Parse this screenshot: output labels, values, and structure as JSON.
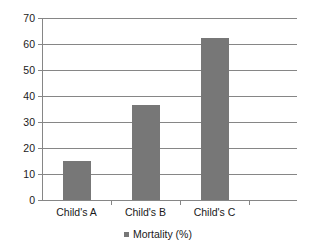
{
  "chart_data": {
    "type": "bar",
    "title": "",
    "subtitle": "",
    "xlabel": "",
    "ylabel": "",
    "categories": [
      "Child's A",
      "Child's B",
      "Child's C"
    ],
    "series": [
      {
        "name": "Mortality (%)",
        "values": [
          15,
          36.5,
          62.5
        ],
        "color": "#777777"
      }
    ],
    "ylim": [
      0,
      70
    ],
    "ytick_step": 10,
    "yticks": [
      0,
      10,
      20,
      30,
      40,
      50,
      60,
      70
    ],
    "ytick_labels": [
      "0",
      "10",
      "20",
      "30",
      "40",
      "50",
      "60",
      "70"
    ],
    "grid": {
      "horizontal": true,
      "vertical": false,
      "color": "#868686"
    },
    "legend": {
      "position": "bottom",
      "entries": [
        {
          "label": "Mortality (%)",
          "color": "#777777",
          "marker": "square"
        }
      ]
    },
    "axis": {
      "y_axis_line": true,
      "x_axis_line": true,
      "line_color": "#868686",
      "plot_background": "#ffffff"
    }
  }
}
